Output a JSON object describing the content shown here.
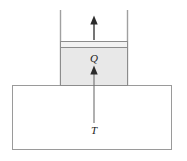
{
  "figure": {
    "background_color": "#ffffff",
    "labels": {
      "heat_label": "Q",
      "temperature_label": "T"
    },
    "colors": {
      "gas_fill": "#e8e8e8",
      "gas_stroke": "#8c8c8c",
      "piston_fill": "#f2f2f2",
      "piston_stroke": "#8c8c8c",
      "reservoir_fill": "#ffffff",
      "reservoir_stroke": "#9a9a9a",
      "wall_stroke": "#a0a0a0",
      "arrow_color": "#2b2b2b",
      "label_color": "#1a1a1a"
    },
    "elements": {
      "cylinder_wall_left": "cylinder left wall",
      "cylinder_wall_right": "cylinder right wall",
      "piston": "piston plate",
      "gas_chamber": "gas chamber",
      "reservoir": "thermal reservoir block",
      "piston_motion_arrow": "upward piston motion arrow",
      "heat_flow_arrow": "upward heat flow arrow"
    }
  }
}
